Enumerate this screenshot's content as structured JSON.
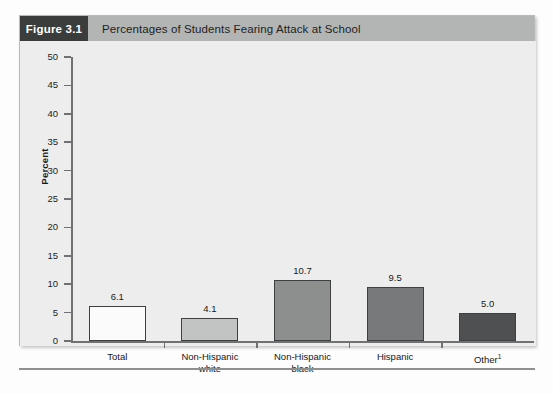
{
  "figure": {
    "tag": "Figure 3.1",
    "title": "Percentages of Students Fearing Attack at School"
  },
  "chart_data": {
    "type": "bar",
    "title": "Percentages of Students Fearing Attack at School",
    "xlabel": "",
    "ylabel": "Percent",
    "ylim": [
      0,
      50
    ],
    "ytick_step": 5,
    "yticks": [
      "50",
      "45",
      "40",
      "35",
      "30",
      "25",
      "20",
      "15",
      "10",
      "5",
      "0"
    ],
    "grid": false,
    "legend": "none",
    "categories": [
      "Total",
      "Non-Hispanic white",
      "Non-Hispanic black",
      "Hispanic",
      "Other¹"
    ],
    "category_lines": [
      [
        "Total",
        ""
      ],
      [
        "Non-Hispanic",
        "white"
      ],
      [
        "Non-Hispanic",
        "black"
      ],
      [
        "Hispanic",
        ""
      ],
      [
        "Other",
        ""
      ]
    ],
    "values": [
      6.1,
      4.1,
      10.7,
      9.5,
      5.0
    ],
    "value_labels": [
      "6.1",
      "4.1",
      "10.7",
      "9.5",
      "5.0"
    ],
    "bar_colors": [
      "#fbfbfb",
      "#c2c3c3",
      "#8d8f8f",
      "#77797a",
      "#4e5051"
    ],
    "bar_border_color": "#3d3f40"
  },
  "colors": {
    "header_tag_bg": "#3b3c3c",
    "header_band_bg": "#b3b5b5",
    "plot_bg": "#ededee",
    "axis": "#6f7172",
    "text": "#16181a"
  }
}
